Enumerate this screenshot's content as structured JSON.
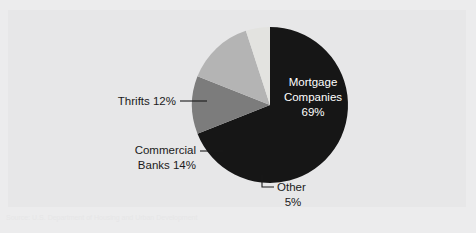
{
  "panel": {
    "background_color": "#e7e7e8",
    "page_background_color": "#ececed"
  },
  "ghost": {
    "header_showthrough": "PARTICIPANTS IN THE MARKET",
    "caption_showthrough": "Source: U.S. Department of Housing and Urban Development"
  },
  "chart_data": {
    "type": "pie",
    "title": "",
    "subtitle": "",
    "xlabel": "",
    "ylabel": "",
    "legend_position": "none",
    "grid": false,
    "units": "percent",
    "total": 100,
    "start_angle_deg": 0,
    "direction": "clockwise",
    "categories": [
      "Mortgage Companies",
      "Thrifts",
      "Commercial Banks",
      "Other"
    ],
    "values": [
      69,
      12,
      14,
      5
    ],
    "slices": [
      {
        "name": "Mortgage Companies",
        "value": 69,
        "value_label": "69%",
        "label_line1": "Mortgage",
        "label_line2": "Companies",
        "label_line3": "69%",
        "color": "#161616",
        "label_placement": "inside",
        "label_color": "#ffffff",
        "leader": false
      },
      {
        "name": "Thrifts",
        "value": 12,
        "value_label": "12%",
        "label_line1": "Thrifts 12%",
        "color": "#7c7c7c",
        "label_placement": "outside-left",
        "label_color": "#1b1b1b",
        "leader": true,
        "leader_style": "straight"
      },
      {
        "name": "Commercial Banks",
        "value": 14,
        "value_label": "14%",
        "label_line1": "Commercial",
        "label_line2": "Banks 14%",
        "color": "#b4b4b4",
        "label_placement": "outside-left",
        "label_color": "#1b1b1b",
        "leader": true,
        "leader_style": "straight"
      },
      {
        "name": "Other",
        "value": 5,
        "value_label": "5%",
        "label_line1": "Other",
        "label_line2": "5%",
        "color": "#e3e3e0",
        "label_placement": "outside-bottom",
        "label_color": "#1b1b1b",
        "leader": true,
        "leader_style": "elbow"
      }
    ]
  }
}
